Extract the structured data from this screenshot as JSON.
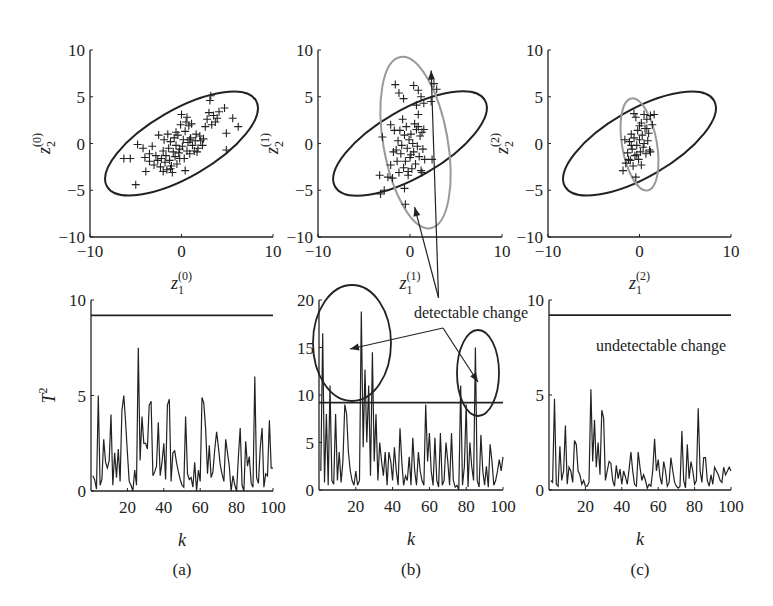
{
  "figure": {
    "captions": [
      "(a)",
      "(b)",
      "(c)"
    ],
    "annotations": {
      "detectable": "detectable change",
      "undetectable": "undetectable change"
    },
    "colors": {
      "ink": "#222222",
      "grey_ellipse": "#9a9a9a"
    }
  },
  "chart_data": [
    {
      "type": "scatter",
      "panel": "a-top",
      "xlabel": "z1(0)",
      "ylabel": "z2(0)",
      "xlim": [
        -10,
        10
      ],
      "ylim": [
        -10,
        10
      ],
      "xticks": [
        "-10",
        "0",
        "10"
      ],
      "yticks": [
        "-10",
        "-5",
        "0",
        "5",
        "10"
      ],
      "x_label_main": "z",
      "x_label_sub": "1",
      "x_label_sup": "(0)",
      "y_label_main": "z",
      "y_label_sub": "2",
      "y_label_sup": "(0)",
      "ellipses": [
        {
          "name": "control limit (reference)",
          "cx": 0,
          "cy": 0,
          "rx": 9.4,
          "ry": 3.6,
          "angle_deg": 30,
          "color": "#222222"
        }
      ],
      "points": [
        [
          -6.3,
          -1.6
        ],
        [
          -5.6,
          -1.6
        ],
        [
          -5.0,
          -4.4
        ],
        [
          -4.8,
          -0.1
        ],
        [
          -4.2,
          -0.5
        ],
        [
          -4.0,
          -1.5
        ],
        [
          -3.9,
          -3.0
        ],
        [
          -3.5,
          -1.9
        ],
        [
          -3.2,
          -0.3
        ],
        [
          -3.0,
          -2.3
        ],
        [
          -2.8,
          -1.3
        ],
        [
          -2.6,
          -1.8
        ],
        [
          -2.5,
          0.9
        ],
        [
          -2.3,
          -2.5
        ],
        [
          -2.2,
          -1.6
        ],
        [
          -2.0,
          -0.8
        ],
        [
          -1.9,
          0.4
        ],
        [
          -1.8,
          -2.0
        ],
        [
          -1.7,
          -1.3
        ],
        [
          -1.6,
          -2.8
        ],
        [
          -1.5,
          1.0
        ],
        [
          -1.4,
          -0.5
        ],
        [
          -1.3,
          -1.8
        ],
        [
          -1.2,
          0.2
        ],
        [
          -1.1,
          -2.4
        ],
        [
          -1.0,
          -3.1
        ],
        [
          -0.9,
          -0.9
        ],
        [
          -0.8,
          0.6
        ],
        [
          -0.7,
          -1.4
        ],
        [
          -0.6,
          -0.2
        ],
        [
          -0.5,
          -2.2
        ],
        [
          -0.4,
          0.9
        ],
        [
          -0.3,
          -1.0
        ],
        [
          -0.2,
          -0.6
        ],
        [
          -0.1,
          2.0
        ],
        [
          0.0,
          3.1
        ],
        [
          0.1,
          -0.3
        ],
        [
          0.2,
          0.4
        ],
        [
          0.3,
          -1.6
        ],
        [
          0.4,
          1.3
        ],
        [
          0.5,
          2.3
        ],
        [
          0.6,
          -0.8
        ],
        [
          0.7,
          0.1
        ],
        [
          0.8,
          1.9
        ],
        [
          0.9,
          -1.1
        ],
        [
          1.0,
          0.6
        ],
        [
          1.1,
          2.1
        ],
        [
          1.2,
          -0.2
        ],
        [
          1.4,
          -0.8
        ],
        [
          1.5,
          0.3
        ],
        [
          1.6,
          1.0
        ],
        [
          1.8,
          -0.5
        ],
        [
          2.0,
          0.8
        ],
        [
          2.1,
          0.3
        ],
        [
          2.3,
          -0.2
        ],
        [
          2.4,
          0.5
        ],
        [
          2.6,
          1.8
        ],
        [
          2.8,
          2.6
        ],
        [
          3.0,
          3.3
        ],
        [
          3.1,
          4.6
        ],
        [
          3.2,
          5.1
        ],
        [
          3.3,
          2.0
        ],
        [
          3.5,
          3.0
        ],
        [
          3.7,
          2.3
        ],
        [
          3.9,
          2.7
        ],
        [
          4.1,
          3.4
        ],
        [
          4.7,
          3.8
        ],
        [
          4.9,
          1.1
        ],
        [
          4.9,
          -0.7
        ],
        [
          5.6,
          2.7
        ],
        [
          6.2,
          1.8
        ],
        [
          -2.0,
          -3.0
        ],
        [
          -1.2,
          -2.7
        ],
        [
          0.4,
          -2.9
        ],
        [
          -0.6,
          1.2
        ],
        [
          0.9,
          0.4
        ],
        [
          1.7,
          -0.9
        ],
        [
          -3.5,
          -1.1
        ],
        [
          -0.2,
          -1.6
        ],
        [
          0.6,
          2.8
        ]
      ]
    },
    {
      "type": "scatter",
      "panel": "b-top",
      "xlabel": "z1(1)",
      "ylabel": "z2(1)",
      "xlim": [
        -10,
        10
      ],
      "ylim": [
        -10,
        10
      ],
      "xticks": [
        "-10",
        "0",
        "10"
      ],
      "yticks": [
        "-10",
        "-5",
        "0",
        "5",
        "10"
      ],
      "x_label_main": "z",
      "x_label_sub": "1",
      "x_label_sup": "(1)",
      "y_label_main": "z",
      "y_label_sub": "2",
      "y_label_sup": "(1)",
      "ellipses": [
        {
          "name": "control limit (reference)",
          "cx": 0,
          "cy": 0,
          "rx": 9.4,
          "ry": 3.6,
          "angle_deg": 30,
          "color": "#222222"
        },
        {
          "name": "changed distribution",
          "cx": 0.6,
          "cy": 0.1,
          "rx": 3.5,
          "ry": 9.3,
          "angle_deg": 10,
          "color": "#9a9a9a"
        }
      ],
      "points": [
        [
          -3.2,
          -5.4
        ],
        [
          -2.8,
          -5.0
        ],
        [
          -3.3,
          -3.4
        ],
        [
          -2.4,
          -3.6
        ],
        [
          -2.1,
          -2.3
        ],
        [
          -1.9,
          -3.7
        ],
        [
          -3.0,
          0.7
        ],
        [
          -2.1,
          2.0
        ],
        [
          -1.7,
          1.4
        ],
        [
          -1.5,
          -0.7
        ],
        [
          -1.4,
          -1.9
        ],
        [
          -1.3,
          0.3
        ],
        [
          -1.2,
          -3.1
        ],
        [
          -1.1,
          1.4
        ],
        [
          -1.0,
          -1.1
        ],
        [
          -0.9,
          -0.2
        ],
        [
          -0.8,
          2.6
        ],
        [
          -0.7,
          -2.6
        ],
        [
          -0.6,
          0.9
        ],
        [
          -0.5,
          -1.9
        ],
        [
          -0.4,
          1.8
        ],
        [
          -0.3,
          -0.5
        ],
        [
          -0.2,
          -3.0
        ],
        [
          -0.1,
          0.4
        ],
        [
          0.0,
          -1.5
        ],
        [
          0.1,
          1.0
        ],
        [
          0.2,
          -2.7
        ],
        [
          0.3,
          0.0
        ],
        [
          0.4,
          -0.9
        ],
        [
          0.5,
          2.1
        ],
        [
          0.6,
          -2.2
        ],
        [
          0.7,
          1.5
        ],
        [
          0.8,
          -0.3
        ],
        [
          0.9,
          1.8
        ],
        [
          1.0,
          -1.4
        ],
        [
          1.1,
          0.8
        ],
        [
          1.2,
          -2.9
        ],
        [
          1.3,
          1.2
        ],
        [
          1.4,
          -0.6
        ],
        [
          1.5,
          1.5
        ],
        [
          1.6,
          -1.7
        ],
        [
          2.4,
          -1.7
        ],
        [
          -1.6,
          6.3
        ],
        [
          -1.2,
          5.4
        ],
        [
          -0.7,
          4.8
        ],
        [
          0.4,
          6.2
        ],
        [
          0.9,
          5.7
        ],
        [
          1.2,
          5.0
        ],
        [
          1.5,
          4.3
        ],
        [
          2.3,
          4.5
        ],
        [
          2.9,
          5.8
        ],
        [
          2.6,
          6.4
        ],
        [
          0.9,
          3.1
        ],
        [
          1.3,
          -3.1
        ],
        [
          -0.2,
          -3.4
        ],
        [
          -0.6,
          -4.8
        ],
        [
          -0.5,
          -6.5
        ],
        [
          0.7,
          4.1
        ],
        [
          0.1,
          -1.2
        ],
        [
          -1.8,
          -0.9
        ]
      ],
      "arrows": [
        {
          "from": [
            3.1,
            -16.5
          ],
          "to": [
            2.3,
            7.8
          ]
        },
        {
          "from": [
            3.1,
            -16.5
          ],
          "to": [
            0.5,
            -6.8
          ]
        }
      ]
    },
    {
      "type": "scatter",
      "panel": "c-top",
      "xlabel": "z1(2)",
      "ylabel": "z2(2)",
      "xlim": [
        -10,
        10
      ],
      "ylim": [
        -10,
        10
      ],
      "xticks": [
        "-10",
        "0",
        "10"
      ],
      "yticks": [
        "-10",
        "-5",
        "0",
        "5",
        "10"
      ],
      "x_label_main": "z",
      "x_label_sub": "1",
      "x_label_sup": "(2)",
      "y_label_main": "z",
      "y_label_sub": "2",
      "y_label_sup": "(2)",
      "ellipses": [
        {
          "name": "control limit (reference)",
          "cx": 0,
          "cy": 0,
          "rx": 9.4,
          "ry": 3.6,
          "angle_deg": 30,
          "color": "#222222"
        },
        {
          "name": "changed distribution",
          "cx": 0.0,
          "cy": -0.1,
          "rx": 1.9,
          "ry": 5.0,
          "angle_deg": 10,
          "color": "#9a9a9a"
        }
      ],
      "points": [
        [
          -1.8,
          -2.9
        ],
        [
          -1.5,
          -2.1
        ],
        [
          -1.3,
          -1.0
        ],
        [
          -1.1,
          0.2
        ],
        [
          -1.0,
          -1.8
        ],
        [
          -0.9,
          1.0
        ],
        [
          -0.8,
          -0.6
        ],
        [
          -0.7,
          -2.4
        ],
        [
          -0.6,
          0.6
        ],
        [
          -0.5,
          -1.3
        ],
        [
          -0.4,
          2.8
        ],
        [
          -0.3,
          -0.2
        ],
        [
          -0.2,
          1.4
        ],
        [
          -0.1,
          -1.7
        ],
        [
          0.0,
          0.4
        ],
        [
          0.1,
          -0.9
        ],
        [
          0.2,
          2.2
        ],
        [
          0.3,
          0.9
        ],
        [
          0.4,
          -0.4
        ],
        [
          0.5,
          3.1
        ],
        [
          0.6,
          1.6
        ],
        [
          0.7,
          -1.1
        ],
        [
          0.8,
          2.6
        ],
        [
          0.9,
          0.3
        ],
        [
          1.0,
          1.1
        ],
        [
          1.1,
          -0.7
        ],
        [
          1.2,
          3.0
        ],
        [
          1.4,
          2.0
        ],
        [
          1.6,
          3.1
        ],
        [
          -0.4,
          -3.6
        ],
        [
          -0.6,
          3.2
        ],
        [
          0.2,
          -2.3
        ],
        [
          -0.9,
          -0.2
        ],
        [
          0.5,
          0.0
        ],
        [
          -1.6,
          0.4
        ],
        [
          1.2,
          -0.9
        ],
        [
          0.0,
          1.9
        ],
        [
          -0.3,
          -1.2
        ],
        [
          0.8,
          1.6
        ],
        [
          -1.2,
          -1.7
        ]
      ]
    },
    {
      "type": "line",
      "panel": "a-bottom",
      "xlabel": "k",
      "ylabel": "T^2",
      "xlim": [
        0,
        100
      ],
      "ylim": [
        0,
        10
      ],
      "xticks": [
        "20",
        "40",
        "60",
        "80",
        "100"
      ],
      "yticks": [
        "0",
        "5",
        "10"
      ],
      "threshold": 9.2,
      "values": [
        0.8,
        0.6,
        0.1,
        5.0,
        0.3,
        0.6,
        2.7,
        1.5,
        1.2,
        1.6,
        4.0,
        0.3,
        2.0,
        0.7,
        2.2,
        0.5,
        4.2,
        5.0,
        3.6,
        2.0,
        0.5,
        0.3,
        0.0,
        1.1,
        0.3,
        7.5,
        1.6,
        3.9,
        2.5,
        2.5,
        2.2,
        4.5,
        4.7,
        0.8,
        1.0,
        1.3,
        3.6,
        0.8,
        1.5,
        2.5,
        0.6,
        4.5,
        4.8,
        0.5,
        2.0,
        2.1,
        1.5,
        1.0,
        0.6,
        0.3,
        0.2,
        3.9,
        0.9,
        0.6,
        0.7,
        0.2,
        1.5,
        0.0,
        1.1,
        0.5,
        4.9,
        4.6,
        3.2,
        0.9,
        2.4,
        0.7,
        1.0,
        2.2,
        3.1,
        2.3,
        1.4,
        0.9,
        0.5,
        2.7,
        2.0,
        1.3,
        0.0,
        0.8,
        0.3,
        0.0,
        1.8,
        3.3,
        0.3,
        0.0,
        2.6,
        1.3,
        1.8,
        0.4,
        0.2,
        6.0,
        0.7,
        0.4,
        2.3,
        3.3,
        0.2,
        0.9,
        0.8,
        3.7,
        1.2,
        1.2
      ]
    },
    {
      "type": "line",
      "panel": "b-bottom",
      "xlabel": "k",
      "ylabel": "",
      "xlim": [
        0,
        100
      ],
      "ylim": [
        0,
        20
      ],
      "xticks": [
        "20",
        "40",
        "60",
        "80",
        "100"
      ],
      "yticks": [
        "0",
        "5",
        "10",
        "15",
        "20"
      ],
      "threshold": 9.2,
      "values": [
        2.0,
        16.5,
        0.8,
        8.0,
        0.5,
        11.0,
        1.0,
        0.6,
        8.0,
        1.0,
        4.0,
        0.8,
        3.0,
        9.0,
        8.0,
        4.0,
        2.0,
        1.0,
        0.5,
        2.0,
        0.5,
        1.0,
        18.8,
        4.5,
        12.7,
        5.0,
        11.0,
        1.5,
        14.5,
        3.0,
        8.0,
        1.0,
        5.0,
        3.0,
        1.5,
        4.0,
        0.5,
        4.0,
        3.0,
        1.0,
        4.5,
        2.0,
        0.5,
        6.5,
        3.0,
        0.5,
        1.5,
        1.0,
        3.5,
        0.5,
        5.5,
        2.0,
        0.5,
        4.0,
        2.0,
        1.0,
        0.5,
        9.0,
        3.0,
        6.0,
        2.0,
        0.5,
        5.5,
        1.0,
        0.3,
        6.0,
        0.5,
        1.0,
        5.0,
        3.0,
        0.5,
        6.0,
        1.0,
        0.3,
        0.5,
        0.0,
        11.0,
        0.5,
        2.5,
        9.0,
        0.3,
        5.0,
        2.5,
        1.0,
        15.0,
        1.0,
        0.3,
        5.8,
        2.0,
        0.5,
        2.5,
        0.3,
        4.8,
        3.0,
        0.5,
        1.0,
        2.0,
        3.2,
        2.0,
        3.5
      ]
    },
    {
      "type": "line",
      "panel": "c-bottom",
      "xlabel": "k",
      "ylabel": "",
      "xlim": [
        0,
        100
      ],
      "ylim": [
        0,
        10
      ],
      "xticks": [
        "20",
        "40",
        "60",
        "80",
        "100"
      ],
      "yticks": [
        "0",
        "5",
        "10"
      ],
      "threshold": 9.2,
      "values": [
        0.5,
        0.4,
        4.8,
        0.3,
        0.2,
        2.3,
        0.5,
        1.0,
        3.4,
        0.3,
        1.2,
        1.0,
        0.4,
        2.6,
        2.4,
        1.0,
        0.8,
        0.3,
        0.5,
        0.2,
        0.2,
        0.4,
        5.3,
        1.5,
        3.7,
        1.2,
        2.5,
        0.8,
        4.2,
        3.8,
        0.5,
        1.0,
        1.5,
        1.4,
        0.5,
        0.2,
        1.3,
        0.6,
        1.1,
        0.3,
        1.0,
        0.7,
        0.3,
        1.1,
        2.0,
        1.0,
        0.3,
        0.2,
        2.0,
        1.2,
        0.5,
        0.8,
        0.5,
        0.1,
        0.3,
        0.2,
        1.0,
        2.7,
        1.0,
        1.6,
        0.7,
        0.3,
        1.5,
        1.0,
        0.2,
        0.4,
        1.7,
        1.0,
        0.4,
        0.2,
        0.1,
        0.2,
        3.1,
        0.5,
        0.1,
        2.4,
        0.6,
        1.5,
        1.0,
        0.3,
        0.5,
        4.3,
        1.0,
        0.4,
        1.7,
        1.7,
        0.5,
        0.2,
        0.8,
        0.3,
        1.2,
        1.0,
        0.8,
        0.5,
        0.4,
        1.2,
        0.8,
        1.0,
        1.2,
        1.0
      ]
    }
  ]
}
